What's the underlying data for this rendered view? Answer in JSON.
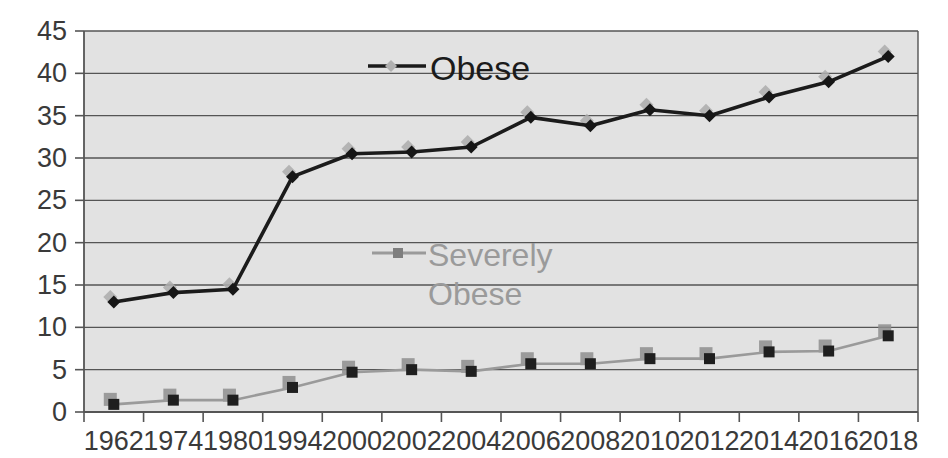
{
  "chart_data": {
    "type": "line",
    "title": "",
    "subtitle": "",
    "xlabel": "",
    "ylabel": "",
    "categories": [
      "1962",
      "1974",
      "1980",
      "1994",
      "2000",
      "2002",
      "2004",
      "2006",
      "2008",
      "2010",
      "2012",
      "2014",
      "2016",
      "2018"
    ],
    "ylim": [
      0,
      45
    ],
    "ytick_step": 5,
    "yticks": [
      "0",
      "5",
      "10",
      "15",
      "20",
      "25",
      "30",
      "35",
      "40",
      "45"
    ],
    "grid": "horizontal",
    "legend_position": "inside-plot",
    "series": [
      {
        "name": "Obese",
        "color": "#1b1b1b",
        "marker": "diamond",
        "values": [
          13.0,
          14.1,
          14.5,
          27.8,
          30.5,
          30.7,
          31.3,
          34.8,
          33.8,
          35.7,
          35.0,
          37.2,
          39.0,
          42.0
        ]
      },
      {
        "name": "Severely Obese",
        "color": "#9a9a9a",
        "marker": "square",
        "values": [
          0.9,
          1.4,
          1.4,
          2.9,
          4.7,
          5.0,
          4.8,
          5.7,
          5.7,
          6.3,
          6.3,
          7.1,
          7.2,
          9.0
        ]
      }
    ]
  },
  "legend": {
    "obese_label": "Obese",
    "severe_label_line1": "Severely",
    "severe_label_line2": "Obese"
  },
  "colors": {
    "plot_background": "#e2e2e2",
    "gridline": "#555555",
    "axis": "#555555",
    "obese": "#1b1b1b",
    "severely_obese": "#9a9a9a",
    "tick_text": "#3a3a3a"
  }
}
